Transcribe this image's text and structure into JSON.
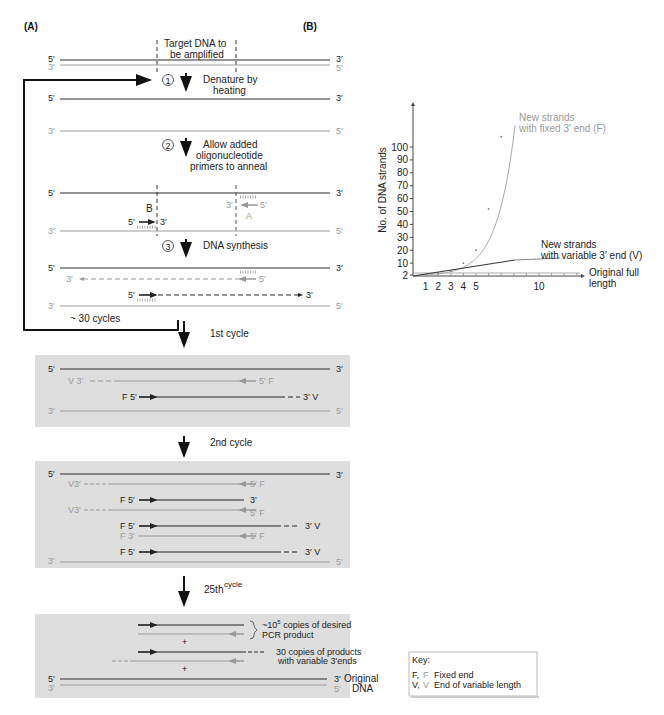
{
  "panels": {
    "a": "(A)",
    "b": "(B)"
  },
  "colors": {
    "dark_strand": "#2a2a2a",
    "light_strand": "#9e9e9e",
    "box_bg": "#dedede",
    "curve_fixed": "#a8a8a8",
    "curve_variable": "#333333"
  },
  "top": {
    "target_label_1": "Target DNA to",
    "target_label_2": "be amplified",
    "five": "5′",
    "three": "3′"
  },
  "steps": [
    {
      "num": "1",
      "label_lines": [
        "Denature by",
        "heating"
      ]
    },
    {
      "num": "2",
      "label_lines": [
        "Allow added",
        "oligonucleotide",
        "primers to anneal"
      ]
    },
    {
      "num": "3",
      "label_lines": [
        "DNA synthesis"
      ]
    }
  ],
  "primers": {
    "b_label": "B",
    "a_label": "A"
  },
  "loop_label": "~ 30 cycles",
  "cycles": {
    "first": "1st cycle",
    "second": "2nd cycle",
    "twentyfifth_main": "25th",
    "twentyfifth_sup": "cycle"
  },
  "box1": {
    "v3": "V 3′",
    "f5_right": "5′ F",
    "f5_left": "F 5′",
    "v3_right": "3′  V"
  },
  "box2": {
    "rows": [
      {
        "left": "V3′",
        "right": "5′ F"
      },
      {
        "left": "F 5′",
        "right": "3′"
      },
      {
        "left": "V3′",
        "right": "5′ F"
      },
      {
        "left": "F 5′",
        "right": "3′  V"
      },
      {
        "left": "F 3′",
        "right": "5′ F"
      },
      {
        "left": "F 5′",
        "right": "3′  V"
      }
    ]
  },
  "box3": {
    "desired_1": "~10",
    "desired_exp": "5",
    "desired_2": " copies of desired",
    "desired_3": "PCR product",
    "plus": "+",
    "variable_1": "30 copies of products",
    "variable_2": "with variable 3′ends",
    "original_1": "Original",
    "original_2": "DNA"
  },
  "key": {
    "title": "Key:",
    "rows": [
      {
        "dark": "F,",
        "light": "F",
        "desc": "Fixed end"
      },
      {
        "dark": "V,",
        "light": "V",
        "desc": "End of variable length"
      }
    ]
  },
  "chart_data": {
    "type": "line",
    "title": "",
    "xlabel": "",
    "ylabel": "No. of DNA strands",
    "x_ticks": [
      1,
      2,
      3,
      4,
      5,
      10
    ],
    "y_ticks": [
      2,
      10,
      20,
      30,
      40,
      50,
      60,
      70,
      80,
      90,
      100
    ],
    "ylim": [
      0,
      130
    ],
    "xlim": [
      0,
      15
    ],
    "grid": false,
    "series": [
      {
        "name": "New strands with fixed 3′ end (F)",
        "x": [
          0,
          1,
          2,
          3,
          4,
          5,
          6,
          7
        ],
        "y": [
          0,
          0,
          2,
          4,
          10,
          20,
          52,
          108
        ],
        "color": "#a8a8a8"
      },
      {
        "name": "New strands with variable 3′ end (V)",
        "x": [
          0,
          1,
          2,
          3,
          10
        ],
        "y": [
          0,
          1,
          2,
          4,
          14
        ],
        "color": "#333333"
      },
      {
        "name": "Original full length",
        "x": [
          0,
          15
        ],
        "y": [
          2,
          2
        ],
        "color": "#555555"
      }
    ],
    "annotations": [
      {
        "text": "New strands",
        "text2": "with fixed 3′ end (F)"
      },
      {
        "text": "New strands",
        "text2": "with variable 3′ end (V)"
      },
      {
        "text": "Original full",
        "text2": "length"
      }
    ]
  }
}
